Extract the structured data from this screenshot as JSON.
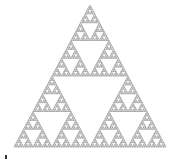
{
  "figure": {
    "name": "Sierpinski triangle",
    "apex": [
      90,
      5
    ],
    "bottom_left": [
      14,
      147
    ],
    "bottom_right": [
      166,
      147
    ],
    "depth": 6,
    "stroke_color": "#8a8a8a",
    "background": "#ffffff"
  },
  "caption": {
    "icon": "marker-icon",
    "text": "",
    "right_text": ""
  }
}
